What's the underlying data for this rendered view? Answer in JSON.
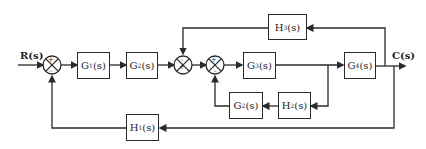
{
  "diagram": {
    "input_label": "R(s)",
    "output_label": "C(s)",
    "blocks": {
      "G1": {
        "name": "G",
        "sub": "1",
        "suffix": "(s)"
      },
      "G2_forward": {
        "name": "G",
        "sub": "2",
        "suffix": "(s)"
      },
      "G3": {
        "name": "G",
        "sub": "3",
        "suffix": "(s)"
      },
      "G4": {
        "name": "G",
        "sub": "4",
        "suffix": "(s)"
      },
      "G2_feedback": {
        "name": "G",
        "sub": "2",
        "suffix": "(s)"
      },
      "H1": {
        "name": "H",
        "sub": "1",
        "suffix": "(s)"
      },
      "H2": {
        "name": "H",
        "sub": "2",
        "suffix": "(s)"
      },
      "H3": {
        "name": "H",
        "sub": "3",
        "suffix": "(s)"
      }
    },
    "summing_junctions": {
      "S1": {
        "input_sign": "+",
        "feedback_sign": "-"
      },
      "S2": {
        "input_sign": "+",
        "feedback_sign": "-"
      },
      "S3": {
        "input_sign": "+",
        "feedback_sign": "-"
      }
    },
    "line_color": "#2a2a2a"
  }
}
